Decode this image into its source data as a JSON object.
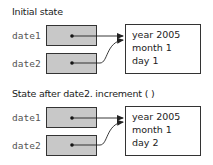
{
  "panels": [
    {
      "title": "Initial state",
      "variables": [
        {
          "name": "date1"
        },
        {
          "name": "date2"
        }
      ],
      "object": {
        "fields": [
          "year 2005",
          "month 1",
          "day 1"
        ]
      }
    },
    {
      "title": "State after date2. increment ( )",
      "variables": [
        {
          "name": "date1"
        },
        {
          "name": "date2"
        }
      ],
      "object": {
        "fields": [
          "year 2005",
          "month 1",
          "day 2"
        ]
      }
    }
  ],
  "colors": {
    "reference_box_fill": "#c8c8c8",
    "stroke": "#333333"
  }
}
